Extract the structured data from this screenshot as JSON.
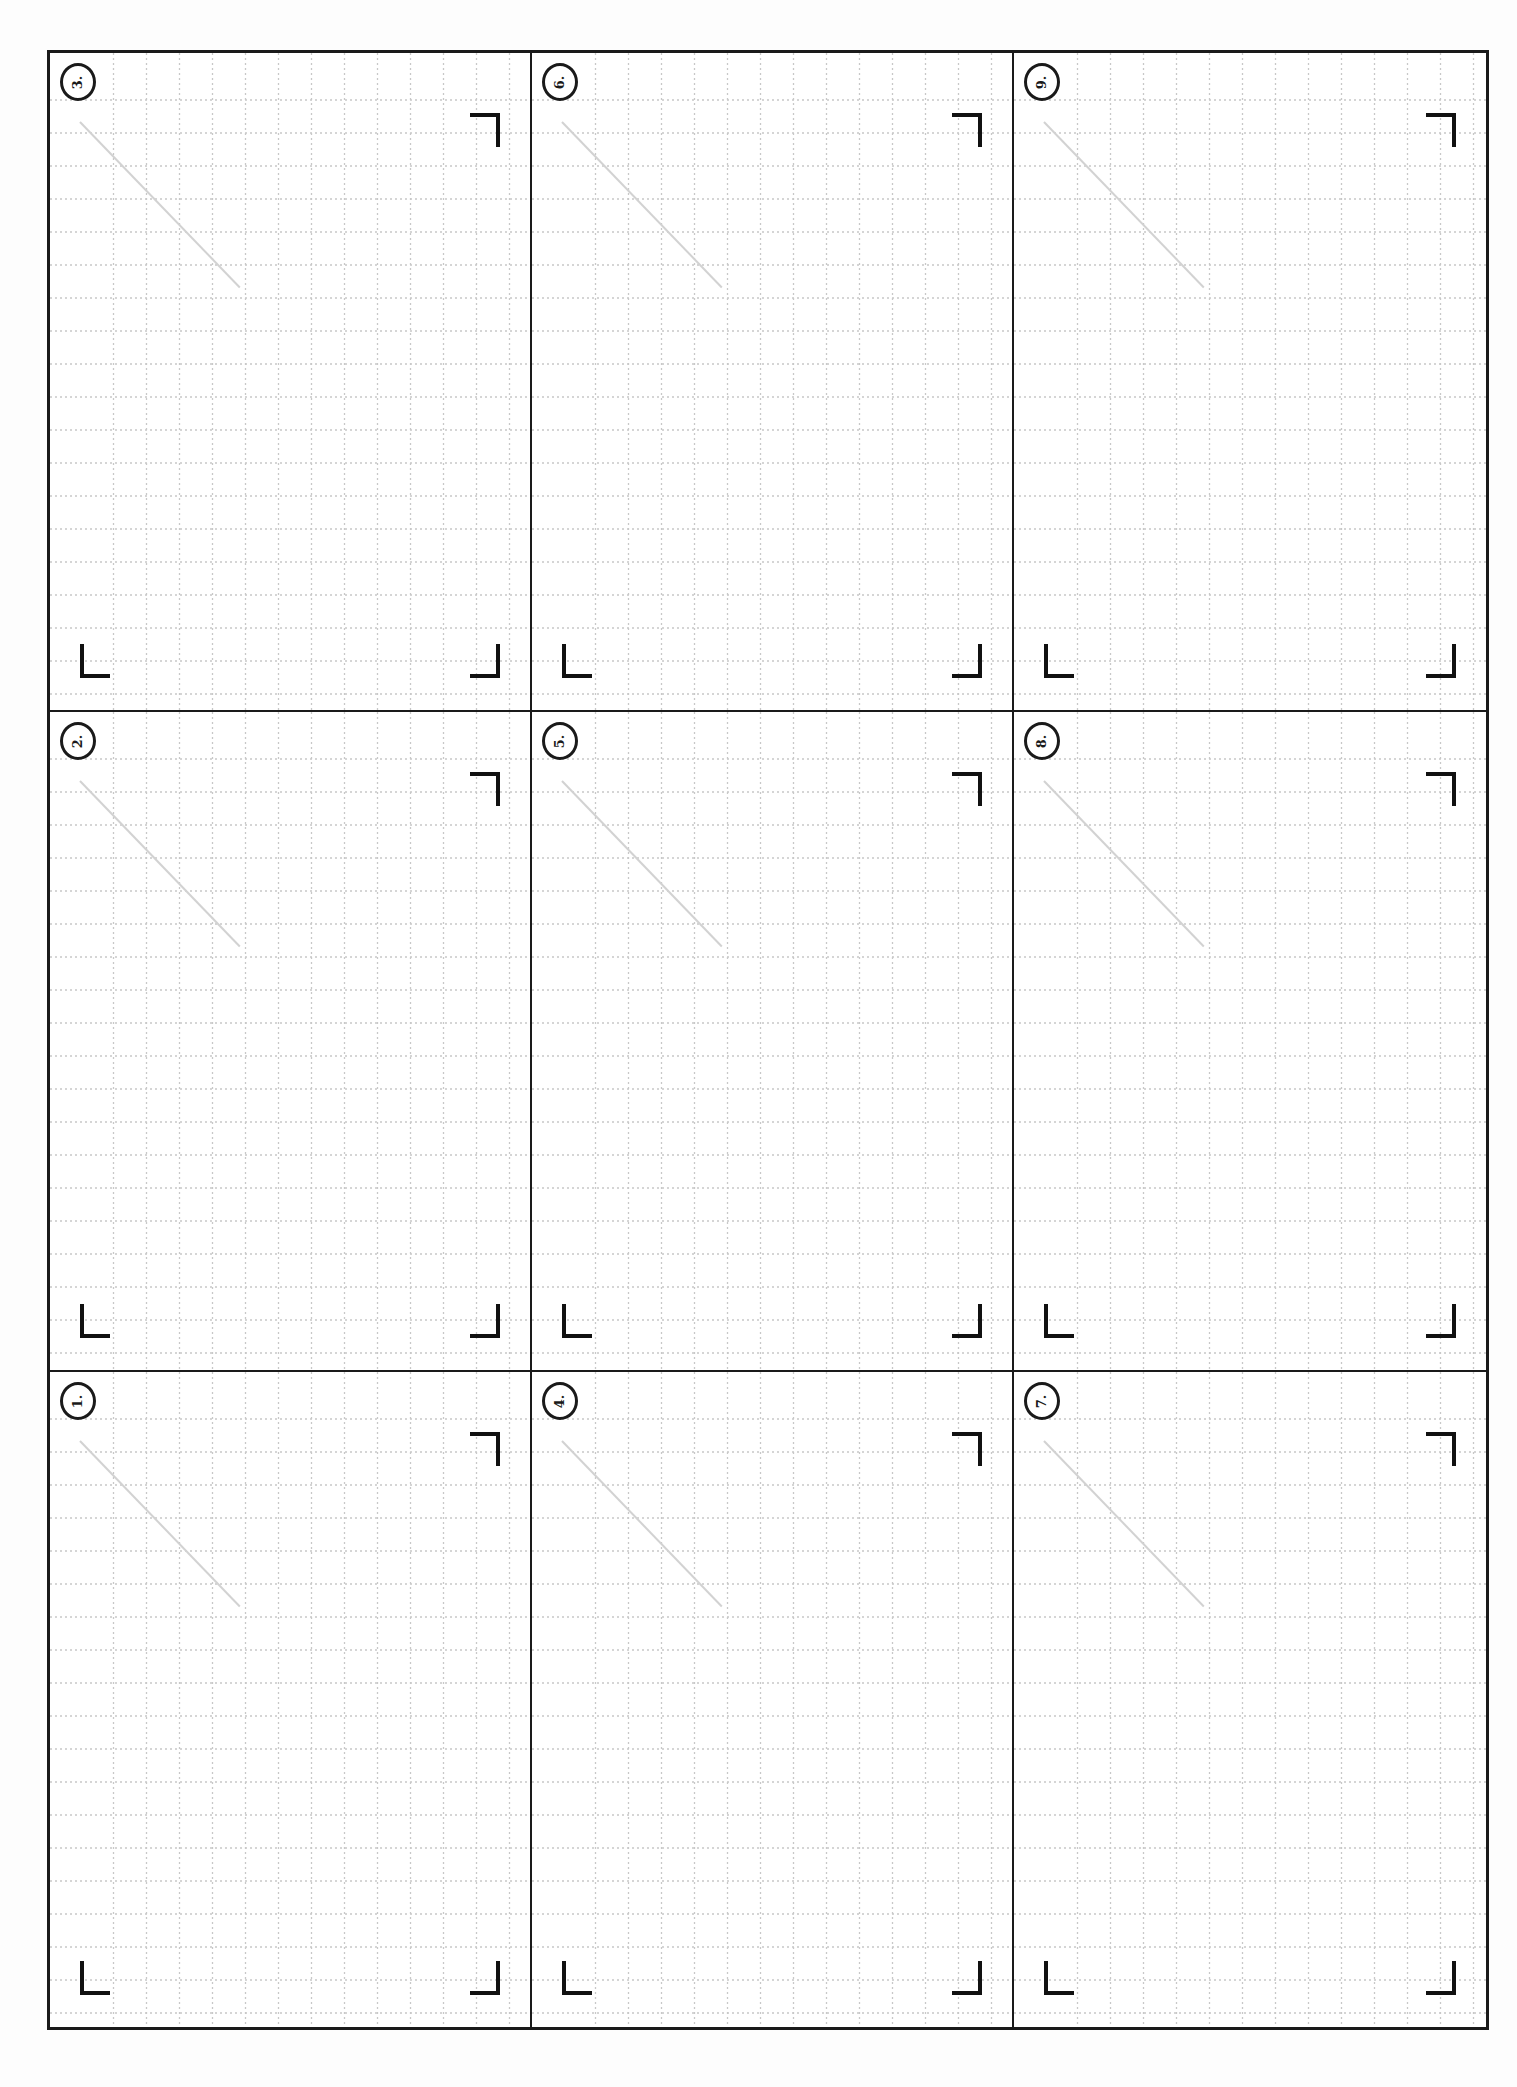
{
  "page": {
    "type": "printable grid template",
    "layout": {
      "rows": 3,
      "columns": 3
    },
    "colors": {
      "frame": "#1a1a1a",
      "grid_line": "#c8c8c8",
      "diagonal_guide": "#d2d2d2",
      "corner_mark": "#111111",
      "background": "#ffffff"
    },
    "grid_spacing_px": 33
  },
  "cells": [
    {
      "row": 0,
      "col": 0,
      "label": "3."
    },
    {
      "row": 0,
      "col": 1,
      "label": "6."
    },
    {
      "row": 0,
      "col": 2,
      "label": "9."
    },
    {
      "row": 1,
      "col": 0,
      "label": "2."
    },
    {
      "row": 1,
      "col": 1,
      "label": "5."
    },
    {
      "row": 1,
      "col": 2,
      "label": "8."
    },
    {
      "row": 2,
      "col": 0,
      "label": "1."
    },
    {
      "row": 2,
      "col": 1,
      "label": "4."
    },
    {
      "row": 2,
      "col": 2,
      "label": "7."
    }
  ]
}
